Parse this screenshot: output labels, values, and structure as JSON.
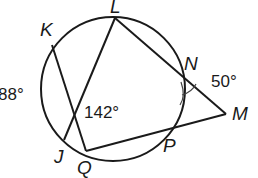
{
  "diagram": {
    "type": "circle-secant-chord-geometry",
    "circle": {
      "cx": 113,
      "cy": 89,
      "r": 72
    },
    "points": {
      "K": {
        "label": "K",
        "x": 52,
        "y": 50
      },
      "L": {
        "label": "L",
        "x": 114,
        "y": 17
      },
      "N": {
        "label": "N",
        "x": 180,
        "y": 68
      },
      "J": {
        "label": "J",
        "x": 64,
        "y": 140
      },
      "Q": {
        "label": "Q",
        "x": 86,
        "y": 151
      },
      "P": {
        "label": "P",
        "x": 160,
        "y": 147
      },
      "M": {
        "label": "M",
        "x": 226,
        "y": 114
      }
    },
    "segments": [
      {
        "from": "K",
        "to": "Q"
      },
      {
        "from": "L",
        "to": "J"
      },
      {
        "from": "L",
        "to": "M"
      },
      {
        "from": "Q",
        "to": "M"
      }
    ],
    "angles": {
      "arc_KJ": "88°",
      "chord_intersection": "142°",
      "angle_M": "50°"
    }
  }
}
